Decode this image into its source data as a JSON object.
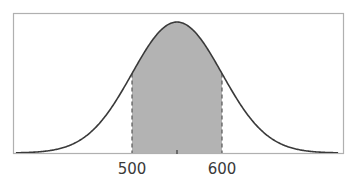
{
  "chart_data": {
    "type": "area",
    "title": "",
    "xlabel": "",
    "ylabel": "",
    "distribution": "normal",
    "mean": 550,
    "std_dev": 50,
    "xlim": [
      375,
      725
    ],
    "grid": false,
    "legend": null,
    "shaded_region": {
      "from": 500,
      "to": 600,
      "fill_color": "#b3b3b3",
      "boundary_style": "dashed"
    },
    "x_ticks": [
      {
        "value": 500,
        "label": "500"
      },
      {
        "value": 550,
        "label": ""
      },
      {
        "value": 600,
        "label": "600"
      }
    ],
    "colors": {
      "curve": "#3a3a3a",
      "frame": "#b0b0b0",
      "fill": "#b3b3b3",
      "boundary": "#555555"
    }
  },
  "labels": {
    "tick_500": "500",
    "tick_600": "600"
  }
}
